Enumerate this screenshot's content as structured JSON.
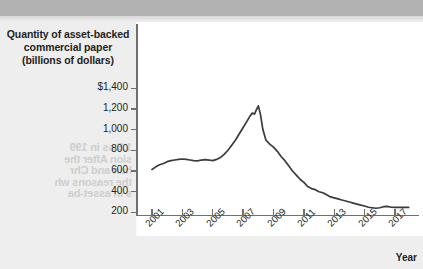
{
  "chart_data": {
    "type": "line",
    "title": "Quantity of asset-backed commercial paper (billions of dollars)",
    "title_lines": [
      "Quantity of asset-backed",
      "commercial paper",
      "(billions of dollars)"
    ],
    "xlabel": "Year",
    "ylabel": "Quantity of asset-backed commercial paper (billions of dollars)",
    "grid": false,
    "legend": false,
    "line_color": "#3b3b3b",
    "ylim": [
      0,
      1400
    ],
    "xlim": [
      2001,
      2018
    ],
    "ytick_labels": [
      "$1,400",
      "1,200",
      "1,000",
      "800",
      "600",
      "400",
      "200"
    ],
    "ytick_values": [
      1400,
      1200,
      1000,
      800,
      600,
      400,
      200
    ],
    "xtick_labels": [
      "2001",
      "2003",
      "2005",
      "2007",
      "2009",
      "2011",
      "2013",
      "2015",
      "2017"
    ],
    "xtick_values": [
      2001,
      2003,
      2005,
      2007,
      2009,
      2011,
      2013,
      2015,
      2017
    ],
    "series": [
      {
        "name": "Asset-backed commercial paper outstanding",
        "x": [
          2001.0,
          2001.25,
          2001.5,
          2001.75,
          2002.0,
          2002.25,
          2002.5,
          2002.75,
          2003.0,
          2003.25,
          2003.5,
          2003.75,
          2004.0,
          2004.25,
          2004.5,
          2004.75,
          2005.0,
          2005.25,
          2005.5,
          2005.75,
          2006.0,
          2006.25,
          2006.5,
          2006.75,
          2007.0,
          2007.25,
          2007.45,
          2007.6,
          2007.75,
          2007.9,
          2008.0,
          2008.15,
          2008.3,
          2008.5,
          2008.75,
          2009.0,
          2009.25,
          2009.5,
          2009.75,
          2010.0,
          2010.25,
          2010.5,
          2010.75,
          2011.0,
          2011.25,
          2011.5,
          2011.75,
          2012.0,
          2012.25,
          2012.5,
          2012.75,
          2013.0,
          2013.25,
          2013.5,
          2013.75,
          2014.0,
          2014.25,
          2014.5,
          2014.75,
          2015.0,
          2015.25,
          2015.5,
          2015.75,
          2016.0,
          2016.25,
          2016.5,
          2016.75,
          2017.0,
          2017.25,
          2017.5,
          2017.9
        ],
        "values": [
          615,
          640,
          660,
          672,
          690,
          700,
          706,
          712,
          716,
          712,
          706,
          700,
          698,
          706,
          710,
          706,
          700,
          712,
          730,
          760,
          800,
          850,
          900,
          960,
          1020,
          1080,
          1130,
          1160,
          1150,
          1200,
          1230,
          1140,
          1000,
          900,
          860,
          830,
          790,
          740,
          700,
          650,
          600,
          560,
          520,
          490,
          450,
          430,
          420,
          400,
          390,
          370,
          350,
          340,
          330,
          320,
          310,
          300,
          290,
          280,
          270,
          262,
          250,
          245,
          240,
          245,
          255,
          258,
          250,
          248,
          250,
          248,
          248
        ]
      }
    ],
    "peak": {
      "year": 2007.9,
      "value": 1230
    },
    "start": {
      "year": 2001,
      "value": 615
    },
    "end": {
      "year": 2018,
      "value": 248
    }
  },
  "page": {
    "bleed_text_lines": [
      "1.5 ss in 199",
      "sion After the",
      "han and Chr",
      "the reasons wh",
      "s in asset-ba"
    ]
  }
}
